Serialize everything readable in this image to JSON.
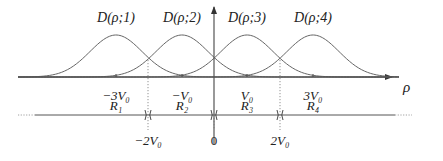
{
  "diagram": {
    "curve_labels": [
      {
        "text": "D(ρ;1)",
        "x": 116
      },
      {
        "text": "D(ρ;2)",
        "x": 182
      },
      {
        "text": "D(ρ;3)",
        "x": 247
      },
      {
        "text": "D(ρ;4)",
        "x": 313
      }
    ],
    "axis_label": "ρ",
    "tick_labels": [
      {
        "text": "−3V₀",
        "x": 116
      },
      {
        "text": "−V₀",
        "x": 182
      },
      {
        "text": "V₀",
        "x": 247
      },
      {
        "text": "3V₀",
        "x": 313
      }
    ],
    "region_labels": [
      {
        "text": "R₁",
        "x": 116
      },
      {
        "text": "R₂",
        "x": 182
      },
      {
        "text": "R₃",
        "x": 247
      },
      {
        "text": "R₄",
        "x": 313
      }
    ],
    "boundary_labels": [
      {
        "text": "−2V₀",
        "x": 148
      },
      {
        "text": "0",
        "x": 214
      },
      {
        "text": "2V₀",
        "x": 280
      }
    ],
    "colors": {
      "line": "#555555",
      "text": "#222222"
    }
  }
}
